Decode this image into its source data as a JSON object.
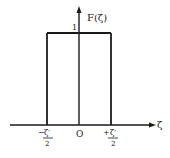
{
  "figure": {
    "function_label": "F(ζ)",
    "height_label": "1",
    "x_axis_label": "ζ",
    "origin_label": "O",
    "left_tick": {
      "sign": "−",
      "numerator": "ζ′",
      "denominator": "2"
    },
    "right_tick": {
      "sign": "+",
      "numerator": "ζ′",
      "denominator": "2"
    }
  },
  "colors": {
    "line": "#1a1a1a",
    "background": "#ffffff"
  }
}
